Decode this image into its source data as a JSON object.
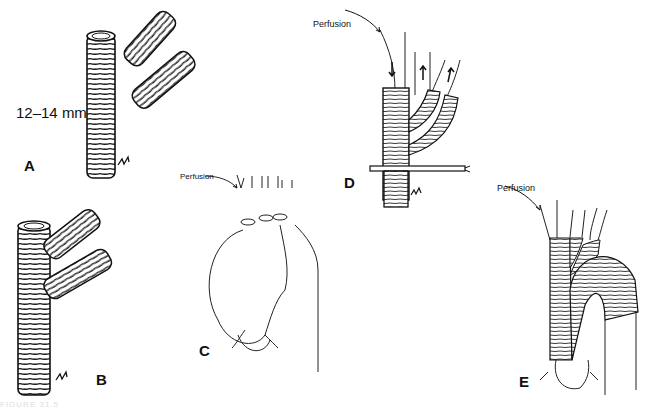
{
  "figure": {
    "caption_partial": "FIGURE 31.5",
    "panels": [
      {
        "id": "A",
        "label": "A",
        "size_label": "12–14 mm",
        "description": "Straight woven graft with two separate side-branch graft segments"
      },
      {
        "id": "B",
        "label": "B",
        "description": "Main graft with two side branches sewn end-to-side"
      },
      {
        "id": "C",
        "label": "C",
        "perfusion_label": "Perfusion",
        "description": "Aortic arch aneurysm with cannulated arch vessels"
      },
      {
        "id": "D",
        "label": "D",
        "perfusion_label": "Perfusion",
        "description": "Branched graft anastomosed to arch vessels with clamp; arrows show flow"
      },
      {
        "id": "E",
        "label": "E",
        "perfusion_label": "Perfusion",
        "description": "Completed arch replacement with branched graft"
      }
    ],
    "signatures": [
      "initials-A",
      "initials-B",
      "initials-D",
      "signature-C",
      "signature-E"
    ]
  }
}
